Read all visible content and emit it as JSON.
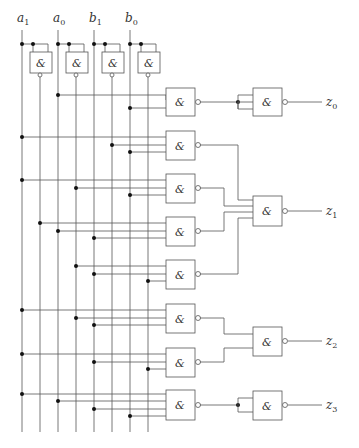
{
  "diagram": {
    "type": "logic-circuit",
    "gate_symbol": "&",
    "inputs": [
      {
        "id": "a1",
        "label": "a",
        "sub": "1",
        "x": 22
      },
      {
        "id": "a0",
        "label": "a",
        "sub": "0",
        "x": 58
      },
      {
        "id": "b1",
        "label": "b",
        "sub": "1",
        "x": 94
      },
      {
        "id": "b0",
        "label": "b",
        "sub": "0",
        "x": 130
      }
    ],
    "inverted_lines": [
      {
        "id": "na1",
        "x": 40
      },
      {
        "id": "na0",
        "x": 76
      },
      {
        "id": "nb1",
        "x": 112
      },
      {
        "id": "nb0",
        "x": 148
      }
    ],
    "outputs": [
      {
        "id": "z0",
        "label": "z",
        "sub": "0",
        "y": 121
      },
      {
        "id": "z1",
        "label": "z",
        "sub": "1",
        "y": 211
      },
      {
        "id": "z2",
        "label": "z",
        "sub": "2",
        "y": 341
      },
      {
        "id": "z3",
        "label": "z",
        "sub": "3",
        "y": 407
      }
    ],
    "first_level_gates": [
      {
        "id": "g1",
        "y": 108,
        "h": 27,
        "inputs": [
          {
            "line": 58,
            "y": 117
          },
          {
            "line": 130,
            "y": 126
          }
        ]
      },
      {
        "id": "g2",
        "y": 131,
        "h": 29,
        "inputs": [
          {
            "line": 22,
            "y": 137
          },
          {
            "line": 112,
            "y": 145
          },
          {
            "line": 130,
            "y": 152
          }
        ]
      },
      {
        "id": "g3",
        "y": 173,
        "h": 29,
        "inputs": [
          {
            "line": 22,
            "y": 180
          },
          {
            "line": 76,
            "y": 188
          },
          {
            "line": 130,
            "y": 195
          }
        ]
      },
      {
        "id": "g4",
        "y": 216,
        "h": 29,
        "inputs": [
          {
            "line": 40,
            "y": 223
          },
          {
            "line": 58,
            "y": 231
          },
          {
            "line": 94,
            "y": 238
          }
        ]
      },
      {
        "id": "g5",
        "y": 259,
        "h": 29,
        "inputs": [
          {
            "line": 76,
            "y": 266
          },
          {
            "line": 94,
            "y": 274
          },
          {
            "line": 148,
            "y": 281
          }
        ]
      },
      {
        "id": "g6",
        "y": 303,
        "h": 29,
        "inputs": [
          {
            "line": 22,
            "y": 310
          },
          {
            "line": 76,
            "y": 318
          },
          {
            "line": 94,
            "y": 325
          }
        ]
      },
      {
        "id": "g7",
        "y": 347,
        "h": 29,
        "inputs": [
          {
            "line": 22,
            "y": 354
          },
          {
            "line": 94,
            "y": 362
          },
          {
            "line": 148,
            "y": 369
          }
        ]
      },
      {
        "id": "g8",
        "y": 391,
        "h": 30,
        "inputs": [
          {
            "line": 22,
            "y": 397
          },
          {
            "line": 58,
            "y": 404
          },
          {
            "line": 94,
            "y": 411
          },
          {
            "line": 130,
            "y": 418
          }
        ]
      }
    ],
    "second_level_gates": [
      {
        "id": "o0",
        "y": 108,
        "h": 28,
        "output": "z0"
      },
      {
        "id": "o1",
        "y": 196,
        "h": 30,
        "output": "z1"
      },
      {
        "id": "o2",
        "y": 327,
        "h": 29,
        "output": "z2"
      },
      {
        "id": "o3",
        "y": 392,
        "h": 29,
        "output": "z3"
      }
    ]
  }
}
